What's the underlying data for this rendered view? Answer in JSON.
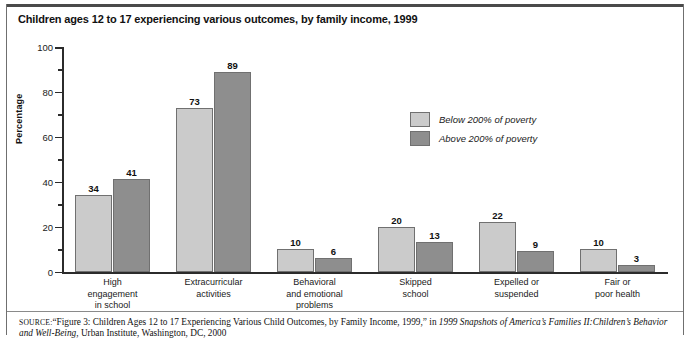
{
  "chart_data": {
    "type": "bar",
    "title": "Children ages 12 to 17 experiencing various outcomes, by family income, 1999",
    "xlabel": "",
    "ylabel": "Percentage",
    "ylim": [
      0,
      100
    ],
    "yticks": [
      0,
      20,
      40,
      60,
      80,
      100
    ],
    "ytick_labels": [
      "0",
      "20",
      "40",
      "60",
      "80",
      "100"
    ],
    "minor_yticks": [
      10,
      30,
      50,
      70,
      90
    ],
    "grid": false,
    "legend_position": "center-right",
    "categories": [
      "High\nengagement\nin school",
      "Extracurricular\nactivities",
      "Behavioral\nand emotional\nproblems",
      "Skipped\nschool",
      "Expelled or\nsuspended",
      "Fair or\npoor health"
    ],
    "series": [
      {
        "name": "Below 200% of poverty",
        "color": "#cbcbcb",
        "values": [
          34,
          73,
          10,
          20,
          22,
          10
        ]
      },
      {
        "name": "Above 200% of poverty",
        "color": "#8e8e8e",
        "values": [
          41,
          89,
          6,
          13,
          9,
          3
        ]
      }
    ]
  },
  "source": {
    "label": "SOURCE:",
    "line1_a": "“Figure 3: Children Ages 12 to 17 Experiencing Various Child Outcomes, by Family Income, 1999,” in ",
    "line1_b": "1999 Snapshots of America’s Families II:",
    "line2_a": "Children’s Behavior and Well-Being",
    "line2_b": ", Urban Institute, Washington, DC, 2000"
  }
}
